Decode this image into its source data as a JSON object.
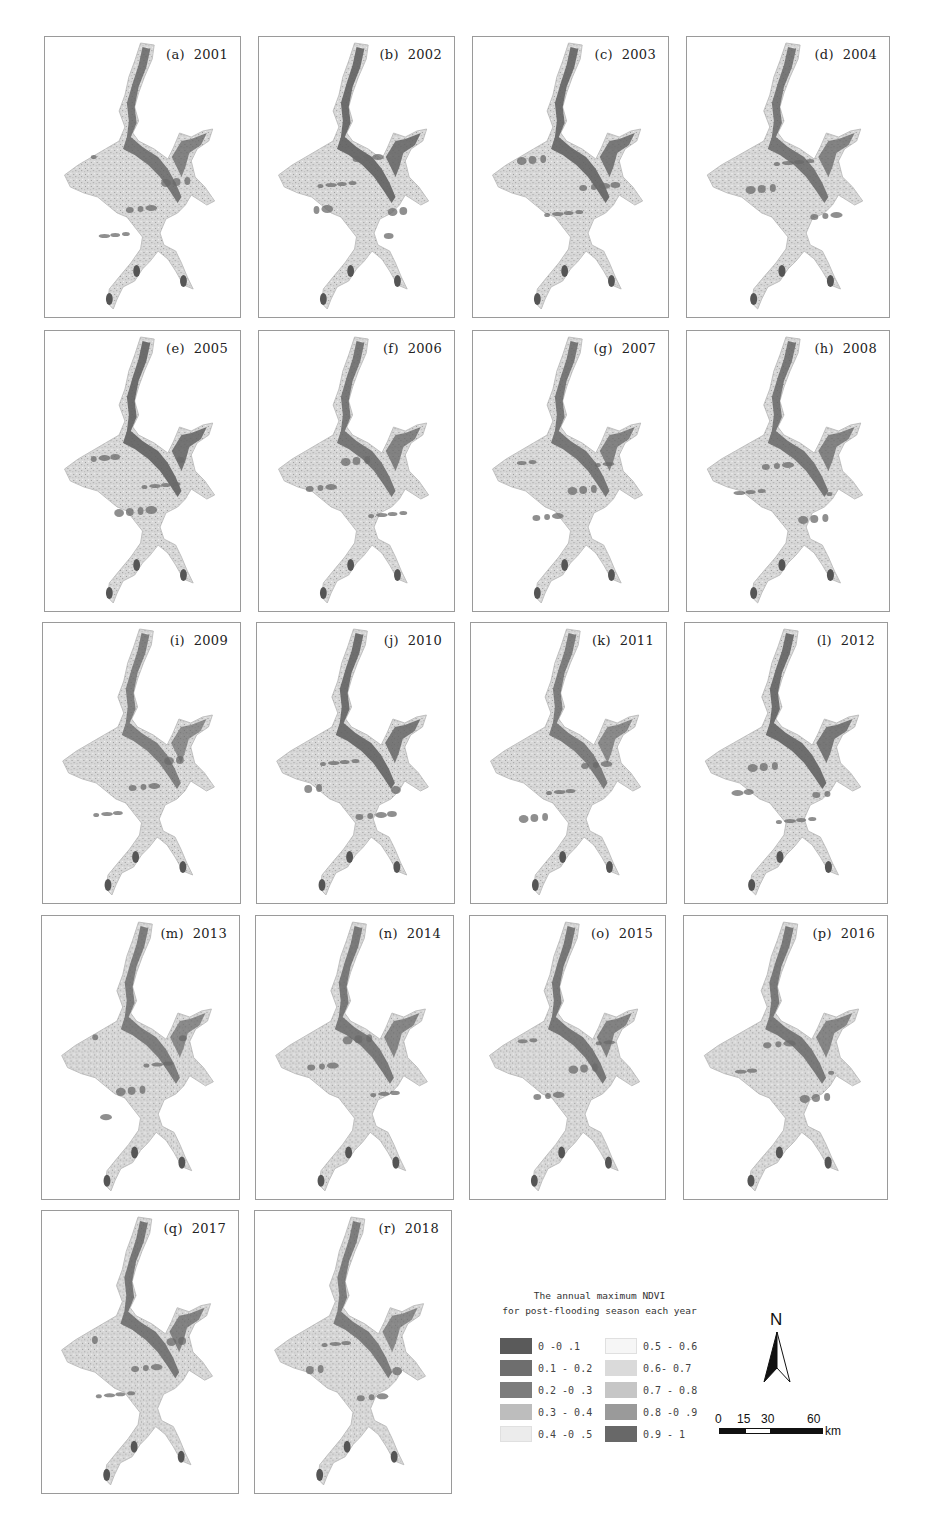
{
  "figure": {
    "panels": [
      {
        "id": "a",
        "label": "(a)  2001",
        "year": 2001,
        "wetness": 0.55
      },
      {
        "id": "b",
        "label": "(b)  2002",
        "year": 2002,
        "wetness": 0.75
      },
      {
        "id": "c",
        "label": "(c)  2003",
        "year": 2003,
        "wetness": 0.7
      },
      {
        "id": "d",
        "label": "(d)  2004",
        "year": 2004,
        "wetness": 0.55
      },
      {
        "id": "e",
        "label": "(e)  2005",
        "year": 2005,
        "wetness": 0.75
      },
      {
        "id": "f",
        "label": "(f)  2006",
        "year": 2006,
        "wetness": 0.55
      },
      {
        "id": "g",
        "label": "(g)  2007",
        "year": 2007,
        "wetness": 0.55
      },
      {
        "id": "h",
        "label": "(h)  2008",
        "year": 2008,
        "wetness": 0.55
      },
      {
        "id": "i",
        "label": "(i)  2009",
        "year": 2009,
        "wetness": 0.4
      },
      {
        "id": "j",
        "label": "(j)  2010",
        "year": 2010,
        "wetness": 0.7
      },
      {
        "id": "k",
        "label": "(k)  2011",
        "year": 2011,
        "wetness": 0.45
      },
      {
        "id": "l",
        "label": "(l)  2012",
        "year": 2012,
        "wetness": 0.7
      },
      {
        "id": "m",
        "label": "(m)  2013",
        "year": 2013,
        "wetness": 0.45
      },
      {
        "id": "n",
        "label": "(n)  2014",
        "year": 2014,
        "wetness": 0.5
      },
      {
        "id": "o",
        "label": "(o)  2015",
        "year": 2015,
        "wetness": 0.55
      },
      {
        "id": "p",
        "label": "(p)  2016",
        "year": 2016,
        "wetness": 0.5
      },
      {
        "id": "q",
        "label": "(q)  2017",
        "year": 2017,
        "wetness": 0.55
      },
      {
        "id": "r",
        "label": "(r)  2018",
        "year": 2018,
        "wetness": 0.45
      }
    ],
    "legend": {
      "title_line1": "The annual maximum NDVI",
      "title_line2": "for post-flooding season each year",
      "classes": [
        {
          "label": "0 -0 .1",
          "color": "#5a5a5a"
        },
        {
          "label": "0.1 - 0.2",
          "color": "#6e6e6e"
        },
        {
          "label": "0.2 -0 .3",
          "color": "#7c7c7c"
        },
        {
          "label": "0.3 - 0.4",
          "color": "#bdbdbd"
        },
        {
          "label": "0.4 -0 .5",
          "color": "#ececec"
        },
        {
          "label": "0.5 - 0.6",
          "color": "#f6f6f6"
        },
        {
          "label": "0.6- 0.7",
          "color": "#dadada"
        },
        {
          "label": "0.7 - 0.8",
          "color": "#c6c6c6"
        },
        {
          "label": "0.8 -0 .9",
          "color": "#9a9a9a"
        },
        {
          "label": "0.9 - 1",
          "color": "#686868"
        }
      ]
    },
    "north_arrow": {
      "label": "N"
    },
    "scale_bar": {
      "ticks": [
        "0",
        "15",
        "30",
        "60"
      ],
      "unit": "km"
    }
  }
}
